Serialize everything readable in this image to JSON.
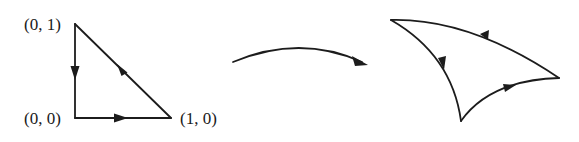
{
  "diagram": {
    "source_triangle": {
      "vertices": [
        {
          "id": "v01",
          "label": "(0, 1)"
        },
        {
          "id": "v00",
          "label": "(0, 0)"
        },
        {
          "id": "v10",
          "label": "(1, 0)"
        }
      ],
      "edges": [
        {
          "from": "(0, 1)",
          "to": "(0, 0)",
          "direction": "down"
        },
        {
          "from": "(0, 0)",
          "to": "(1, 0)",
          "direction": "right"
        },
        {
          "from": "(1, 0)",
          "to": "(0, 1)",
          "direction": "up-left"
        }
      ]
    },
    "mapping_arrow": {
      "description": "curved arrow indicating a map"
    },
    "image_triangle": {
      "description": "curvilinear triangle with oriented edges",
      "edges": [
        {
          "name": "left-edge",
          "direction": "down"
        },
        {
          "name": "bottom-edge",
          "direction": "up-right"
        },
        {
          "name": "top-edge",
          "direction": "left"
        }
      ]
    }
  }
}
